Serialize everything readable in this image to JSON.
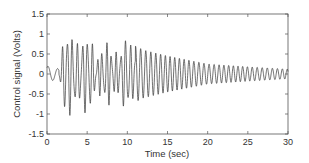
{
  "chart_data": {
    "type": "line",
    "title": "",
    "xlabel": "Time (sec)",
    "ylabel": "Control signal (Volts)",
    "xlim": [
      0,
      30
    ],
    "ylim": [
      -1.5,
      1.5
    ],
    "xticks": [
      0,
      5,
      10,
      15,
      20,
      25,
      30
    ],
    "yticks": [
      -1.5,
      -1,
      -0.5,
      0,
      0.5,
      1,
      1.5
    ],
    "xtick_labels": [
      "0",
      "5",
      "10",
      "15",
      "20",
      "25",
      "30"
    ],
    "ytick_labels": [
      "-1.5",
      "-1",
      "-0.5",
      "0",
      "0.5",
      "1",
      "1.5"
    ],
    "grid": false,
    "legend": null,
    "series": [
      {
        "name": "Control signal",
        "color": "#333333",
        "description": "Small initial bump near 0-1.5 s, then large-amplitude irregular oscillation (peaks near ±1) between ~1.5 and ~10 s, followed by a decaying oscillation shrinking to about ±0.15 by 30 s",
        "envelope": {
          "t": [
            0,
            0.5,
            1.5,
            2,
            4,
            6,
            8,
            10,
            12,
            15,
            20,
            25,
            30
          ],
          "amplitude": [
            0.2,
            0.2,
            0.15,
            0.9,
            0.95,
            1.0,
            1.0,
            0.8,
            0.6,
            0.45,
            0.25,
            0.18,
            0.12
          ]
        }
      }
    ]
  },
  "plot": {
    "x_label": "Time (sec)",
    "y_label": "Control signal (Volts)"
  }
}
